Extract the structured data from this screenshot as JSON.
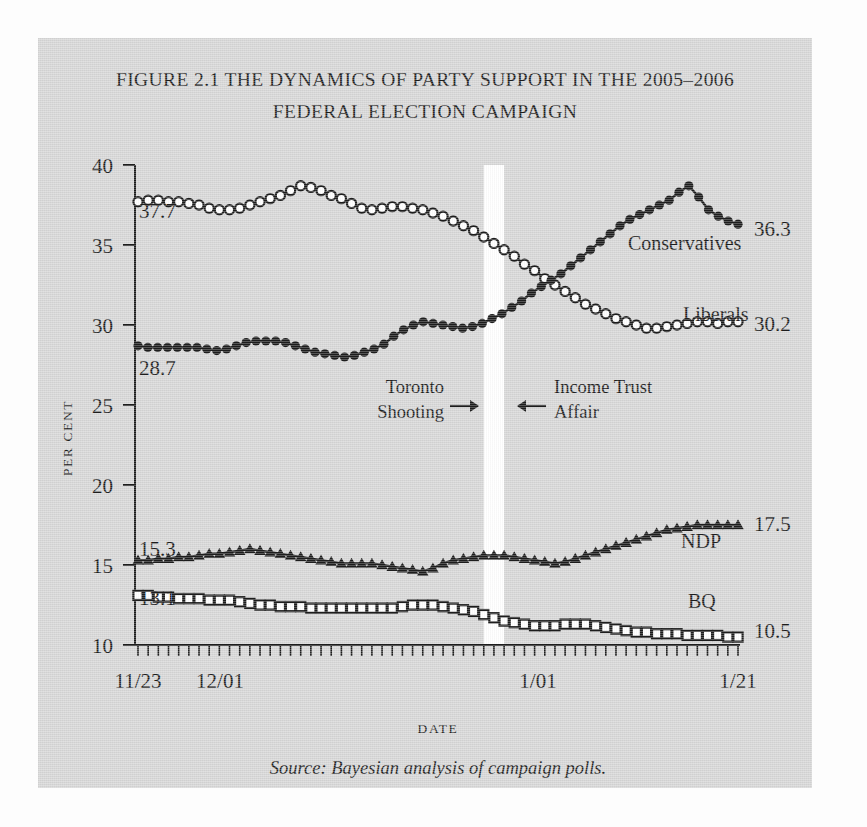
{
  "figure": {
    "title_line1": "FIGURE 2.1 THE DYNAMICS OF PARTY SUPPORT IN THE 2005–2006",
    "title_line2": "FEDERAL ELECTION CAMPAIGN",
    "source_note": "Source: Bayesian analysis of campaign polls.",
    "panel_color": "#d7d7d7",
    "ink_color": "#1d1d1d"
  },
  "chart_data": {
    "type": "line",
    "title": "FIGURE 2.1 THE DYNAMICS OF PARTY SUPPORT IN THE 2005–2006 FEDERAL ELECTION CAMPAIGN",
    "xlabel": "DATE",
    "ylabel": "PER CENT",
    "ylim": [
      10,
      40
    ],
    "yticks": [
      10,
      15,
      20,
      25,
      30,
      35,
      40
    ],
    "ytick_labels": [
      "10",
      "15",
      "20",
      "25",
      "30",
      "35",
      "40"
    ],
    "xlim": [
      "11/23",
      "1/21"
    ],
    "xticks": [
      "11/23",
      "12/01",
      "1/01",
      "1/21"
    ],
    "xtick_labels": [
      "11/23",
      "12/01",
      "1/01",
      "1/21"
    ],
    "xtick_days": [
      0,
      8,
      39,
      59
    ],
    "x_minor_tick_count": 60,
    "grid": false,
    "legend": "inline-labels",
    "marker_styles": {
      "Liberals": "open-circle",
      "Conservatives": "filled-circle",
      "NDP": "filled-triangle",
      "BQ": "open-square"
    },
    "series": [
      {
        "name": "Liberals",
        "label": "Liberals",
        "marker": "open-circle",
        "start_value": 37.7,
        "end_value": 30.2,
        "start_label": "37.7",
        "end_label": "30.2",
        "values": [
          37.7,
          37.8,
          37.8,
          37.7,
          37.7,
          37.6,
          37.5,
          37.3,
          37.2,
          37.2,
          37.3,
          37.5,
          37.7,
          37.9,
          38.1,
          38.4,
          38.7,
          38.6,
          38.4,
          38.1,
          37.9,
          37.6,
          37.3,
          37.2,
          37.3,
          37.4,
          37.4,
          37.3,
          37.2,
          37.0,
          36.8,
          36.5,
          36.2,
          35.9,
          35.5,
          35.1,
          34.7,
          34.3,
          33.8,
          33.4,
          32.9,
          32.5,
          32.1,
          31.7,
          31.3,
          31.0,
          30.7,
          30.4,
          30.2,
          30.0,
          29.8,
          29.8,
          29.9,
          30.0,
          30.1,
          30.2,
          30.2,
          30.1,
          30.2,
          30.2
        ]
      },
      {
        "name": "Conservatives",
        "label": "Conservatives",
        "marker": "filled-circle",
        "start_value": 28.7,
        "end_value": 36.3,
        "start_label": "28.7",
        "end_label": "36.3",
        "values": [
          28.7,
          28.6,
          28.6,
          28.6,
          28.6,
          28.6,
          28.6,
          28.5,
          28.4,
          28.5,
          28.7,
          28.9,
          29.0,
          29.0,
          29.0,
          28.9,
          28.7,
          28.5,
          28.3,
          28.2,
          28.1,
          28.0,
          28.1,
          28.3,
          28.5,
          28.8,
          29.3,
          29.7,
          30.0,
          30.2,
          30.1,
          30.0,
          29.9,
          29.8,
          29.9,
          30.1,
          30.4,
          30.7,
          31.1,
          31.5,
          32.0,
          32.4,
          32.8,
          33.2,
          33.7,
          34.2,
          34.7,
          35.2,
          35.7,
          36.2,
          36.6,
          36.9,
          37.2,
          37.5,
          37.8,
          38.3,
          38.7,
          38.0,
          37.2,
          36.8,
          36.5,
          36.3
        ]
      },
      {
        "name": "NDP",
        "label": "NDP",
        "marker": "filled-triangle",
        "start_value": 15.3,
        "end_value": 17.5,
        "start_label": "15.3",
        "end_label": "17.5",
        "values": [
          15.3,
          15.3,
          15.4,
          15.4,
          15.5,
          15.5,
          15.6,
          15.7,
          15.7,
          15.8,
          15.9,
          16.0,
          15.9,
          15.8,
          15.7,
          15.6,
          15.5,
          15.4,
          15.3,
          15.2,
          15.1,
          15.1,
          15.1,
          15.1,
          15.0,
          14.9,
          14.8,
          14.7,
          14.6,
          14.8,
          15.1,
          15.3,
          15.4,
          15.5,
          15.6,
          15.6,
          15.6,
          15.5,
          15.4,
          15.3,
          15.2,
          15.1,
          15.2,
          15.4,
          15.6,
          15.8,
          16.0,
          16.2,
          16.4,
          16.6,
          16.8,
          17.0,
          17.2,
          17.3,
          17.4,
          17.5,
          17.5,
          17.5,
          17.5,
          17.5
        ]
      },
      {
        "name": "BQ",
        "label": "BQ",
        "marker": "open-square",
        "start_value": 13.1,
        "end_value": 10.5,
        "start_label": "13.1",
        "end_label": "10.5",
        "values": [
          13.1,
          13.1,
          13.0,
          13.0,
          12.9,
          12.9,
          12.9,
          12.8,
          12.8,
          12.8,
          12.7,
          12.6,
          12.5,
          12.5,
          12.4,
          12.4,
          12.4,
          12.3,
          12.3,
          12.3,
          12.3,
          12.3,
          12.3,
          12.3,
          12.3,
          12.3,
          12.4,
          12.5,
          12.5,
          12.5,
          12.4,
          12.3,
          12.2,
          12.1,
          11.9,
          11.7,
          11.5,
          11.4,
          11.3,
          11.2,
          11.2,
          11.2,
          11.3,
          11.3,
          11.3,
          11.2,
          11.1,
          11.0,
          10.9,
          10.8,
          10.8,
          10.7,
          10.7,
          10.7,
          10.6,
          10.6,
          10.6,
          10.6,
          10.5,
          10.5
        ]
      }
    ],
    "annotations": [
      {
        "text_line1": "Toronto",
        "text_line2": "Shooting",
        "arrow": "right-arrow",
        "target": "event-band"
      },
      {
        "text_line1": "Income Trust",
        "text_line2": "Affair",
        "arrow": "left-arrow",
        "target": "event-band"
      }
    ],
    "event_band": {
      "label": "white vertical band",
      "color": "#ffffff",
      "x_days_start": 34,
      "x_days_end": 36
    }
  }
}
